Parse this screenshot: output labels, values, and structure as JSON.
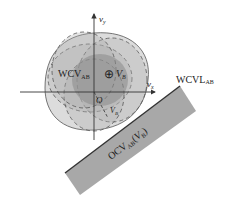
{
  "diagram": {
    "axes": {
      "x_label": "v",
      "x_sub": "x",
      "y_label": "v",
      "y_sub": "y",
      "origin_label": "O"
    },
    "labels": {
      "wcv_main": "WCV",
      "wcv_sub": "AB",
      "vb_symbol": "⊕",
      "vb_main": "V",
      "vb_sub": "B",
      "vb_small_main": "V",
      "vb_small_sub": "B",
      "wcvl_main": "WCVL",
      "wcvl_sub": "AB",
      "ocv_main": "OCV",
      "ocv_sub": "AB",
      "ocv_arg_open": "(",
      "ocv_arg_main": "V",
      "ocv_arg_sub": "B",
      "ocv_arg_close": ")"
    },
    "colors": {
      "outer_region": "#d9d9d9",
      "mid_region": "#bdbdbd",
      "inner_region": "#8f8f8f",
      "band_fill": "#a8a8a8",
      "band_edge": "#333333",
      "line": "#333333"
    }
  }
}
